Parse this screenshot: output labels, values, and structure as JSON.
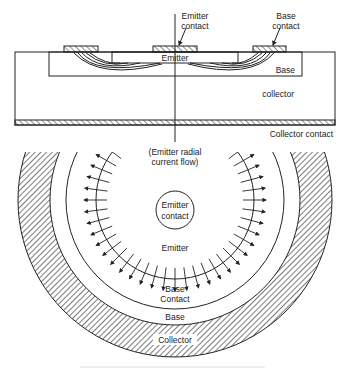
{
  "figure": {
    "cross_section": {
      "labels": {
        "emitter_contact_l1": "Emitter",
        "emitter_contact_l2": "contact",
        "base_contact_l1": "Base",
        "base_contact_l2": "contact",
        "emitter": "Emitter",
        "base": "Base",
        "collector": "collector",
        "collector_contact": "Collector contact"
      }
    },
    "top_view": {
      "labels": {
        "flow_l1": "(Emitter radial",
        "flow_l2": "current flow)",
        "emitter_contact_l1": "Emitter",
        "emitter_contact_l2": "contact",
        "emitter": "Emitter",
        "base_contact_l1": "Base",
        "base_contact_l2": "Contact",
        "base": "Base",
        "collector": "Collector"
      }
    },
    "colors": {
      "line": "#222222",
      "background": "#ffffff"
    }
  }
}
